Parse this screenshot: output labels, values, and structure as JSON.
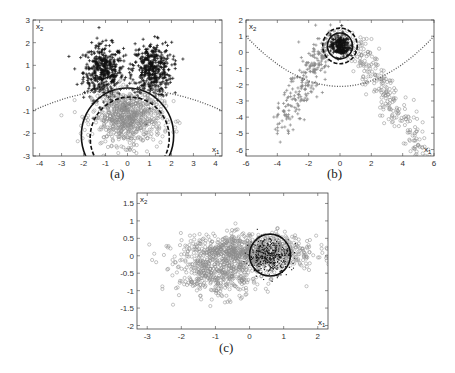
{
  "chart_data": [
    {
      "id": "a",
      "type": "scatter",
      "caption": "(a)",
      "xlabel": "x1",
      "ylabel": "x2",
      "xlim": [
        -4.3,
        4.3
      ],
      "ylim": [
        -3,
        3
      ],
      "xticks": [
        -4,
        -3,
        -2,
        -1,
        0,
        1,
        2,
        3,
        4
      ],
      "yticks": [
        -3,
        -2,
        -1,
        0,
        1,
        2,
        3
      ],
      "grid": false,
      "series": [
        {
          "name": "class1-left-cluster",
          "marker": "+",
          "color": "#111111",
          "center": [
            -1.1,
            0.7
          ],
          "spread": [
            0.45,
            0.6
          ],
          "count": 420
        },
        {
          "name": "class1-right-cluster",
          "marker": "+",
          "color": "#111111",
          "center": [
            1.1,
            0.8
          ],
          "spread": [
            0.45,
            0.6
          ],
          "count": 420
        },
        {
          "name": "class2",
          "marker": "o",
          "color": "#8a8a8a",
          "center": [
            0.0,
            -1.3
          ],
          "spread": [
            0.8,
            0.6
          ],
          "count": 700
        }
      ],
      "curves": [
        {
          "name": "solid-circle",
          "style": "solid",
          "cx": 0.0,
          "cy": -2.1,
          "r": 2.1
        },
        {
          "name": "dashed-circle",
          "style": "dashed",
          "cx": 0.1,
          "cy": -2.2,
          "r": 1.8
        },
        {
          "name": "dotted-parabola",
          "style": "dotted",
          "points": [
            [
              -4.3,
              -1.0
            ],
            [
              -2,
              -0.3
            ],
            [
              0,
              -0.05
            ],
            [
              2,
              -0.3
            ],
            [
              4.3,
              -1.0
            ]
          ]
        }
      ]
    },
    {
      "id": "b",
      "type": "scatter",
      "caption": "(b)",
      "xlabel": "x1",
      "ylabel": "x2",
      "xlim": [
        -6,
        6
      ],
      "ylim": [
        -6.4,
        2
      ],
      "xticks": [
        -6,
        -4,
        -2,
        0,
        2,
        4,
        6
      ],
      "yticks": [
        -6,
        -5,
        -4,
        -3,
        -2,
        -1,
        0,
        1,
        2
      ],
      "grid": false,
      "series": [
        {
          "name": "class1-left-arm",
          "marker": "+",
          "color": "#888888",
          "from": [
            -0.5,
            1.0
          ],
          "to": [
            -3.8,
            -4.5
          ],
          "count": 260
        },
        {
          "name": "class2-right-arm",
          "marker": "o",
          "color": "#888888",
          "from": [
            0.5,
            1.0
          ],
          "to": [
            5.2,
            -5.9
          ],
          "count": 260
        },
        {
          "name": "core",
          "marker": "+",
          "color": "#111111",
          "center": [
            0.0,
            0.4
          ],
          "spread": [
            0.3,
            0.35
          ],
          "count": 200
        }
      ],
      "curves": [
        {
          "name": "solid-circle",
          "style": "solid",
          "cx": 0.0,
          "cy": 0.4,
          "r": 0.8
        },
        {
          "name": "dashed-circle",
          "style": "dashed",
          "cx": 0.0,
          "cy": 0.4,
          "r": 1.1
        },
        {
          "name": "dotted-parabola",
          "style": "dotted",
          "points": [
            [
              -6,
              1.0
            ],
            [
              -3,
              -1.3
            ],
            [
              0,
              -2.1
            ],
            [
              3,
              -1.3
            ],
            [
              6,
              1.0
            ]
          ]
        }
      ]
    },
    {
      "id": "c",
      "type": "scatter",
      "caption": "(c)",
      "xlabel": "x1",
      "ylabel": "x2",
      "xlim": [
        -3.3,
        2.3
      ],
      "ylim": [
        -2.1,
        1.8
      ],
      "xticks": [
        -3,
        -2,
        -1,
        0,
        1,
        2
      ],
      "yticks": [
        -2,
        -1.5,
        -1,
        -0.5,
        0,
        0.5,
        1,
        1.5
      ],
      "grid": false,
      "series": [
        {
          "name": "gray-band",
          "marker": "o",
          "color": "#8a8a8a",
          "center": [
            0.0,
            0.1
          ],
          "spread": [
            1.0,
            0.25
          ],
          "count": 900
        },
        {
          "name": "gray-lower",
          "marker": "o",
          "color": "#8a8a8a",
          "center": [
            -0.9,
            -0.6
          ],
          "spread": [
            0.6,
            0.3
          ],
          "count": 350
        },
        {
          "name": "dark-dots",
          "marker": ".",
          "color": "#111111",
          "center": [
            0.6,
            0.0
          ],
          "spread": [
            0.3,
            0.25
          ],
          "count": 380
        }
      ],
      "curves": [
        {
          "name": "solid-circle",
          "style": "solid",
          "cx": 0.6,
          "cy": 0.02,
          "r": 0.6
        }
      ]
    }
  ]
}
